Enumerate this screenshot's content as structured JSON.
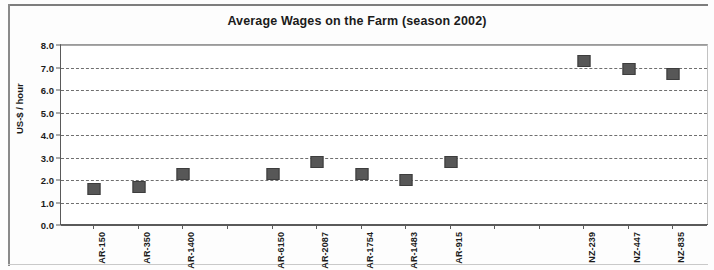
{
  "chart_data": {
    "type": "scatter",
    "title": "Average Wages on the Farm (season 2002)",
    "xlabel": "",
    "ylabel": "US-$ / hour",
    "ylim": [
      0.0,
      8.0
    ],
    "ytick_labels": [
      "8.0",
      "7.0",
      "6.0",
      "5.0",
      "4.0",
      "3.0",
      "2.0",
      "1.0",
      "0.0"
    ],
    "ytick_values": [
      8.0,
      7.0,
      6.0,
      5.0,
      4.0,
      3.0,
      2.0,
      1.0,
      0.0
    ],
    "grid": true,
    "legend": false,
    "marker_color": "#575757",
    "categories": [
      "AR-150",
      "AR-350",
      "AR-1400",
      "",
      "AR-6150",
      "AR-2087",
      "AR-1754",
      "AR-1483",
      "AR-915",
      "",
      "",
      "NZ-239",
      "NZ-447",
      "NZ-835"
    ],
    "values": [
      1.6,
      1.7,
      2.25,
      null,
      2.25,
      2.8,
      2.25,
      2.0,
      2.8,
      null,
      null,
      7.3,
      6.95,
      6.7
    ],
    "points": [
      {
        "label": "AR-150",
        "value": 1.6
      },
      {
        "label": "AR-350",
        "value": 1.7
      },
      {
        "label": "AR-1400",
        "value": 2.25
      },
      {
        "label": "AR-6150",
        "value": 2.25
      },
      {
        "label": "AR-2087",
        "value": 2.8
      },
      {
        "label": "AR-1754",
        "value": 2.25
      },
      {
        "label": "AR-1483",
        "value": 2.0
      },
      {
        "label": "AR-915",
        "value": 2.8
      },
      {
        "label": "NZ-239",
        "value": 7.3
      },
      {
        "label": "NZ-447",
        "value": 6.95
      },
      {
        "label": "NZ-835",
        "value": 6.7
      }
    ]
  }
}
